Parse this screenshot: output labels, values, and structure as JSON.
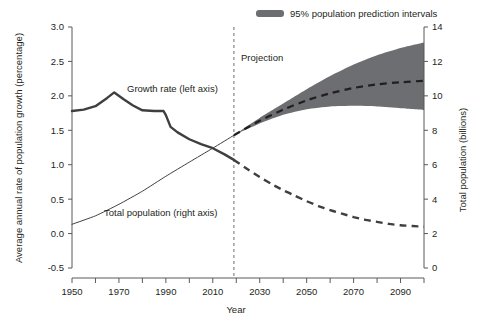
{
  "chart_data": {
    "type": "line",
    "title": "",
    "xlabel": "Year",
    "ylabel": "Average annual rate of population growth (percentage)",
    "y2label": "Total population (billions)",
    "xlim": [
      1950,
      2100
    ],
    "ylim": [
      -0.5,
      3.0
    ],
    "y2lim": [
      0,
      14
    ],
    "grid": false,
    "legend_position": "top-right",
    "x_ticks": [
      1950,
      1960,
      1970,
      1980,
      1990,
      2000,
      2010,
      2020,
      2030,
      2040,
      2050,
      2060,
      2070,
      2080,
      2090,
      2100
    ],
    "x_tick_labels": [
      "1950",
      "",
      "1970",
      "",
      "1990",
      "",
      "2010",
      "",
      "2030",
      "",
      "2050",
      "",
      "2070",
      "",
      "2090",
      ""
    ],
    "y_ticks": [
      -0.5,
      0.0,
      0.5,
      1.0,
      1.5,
      2.0,
      2.5,
      3.0
    ],
    "y_tick_labels": [
      "-0.5",
      "0.0",
      "0.5",
      "1.0",
      "1.5",
      "2.0",
      "2.5",
      "3.0"
    ],
    "y2_ticks": [
      0,
      2,
      4,
      6,
      8,
      10,
      12,
      14
    ],
    "y2_tick_labels": [
      "0",
      "2",
      "4",
      "6",
      "8",
      "10",
      "12",
      "14"
    ],
    "projection_year": 2019,
    "annotations": [
      {
        "text": "Projection",
        "x": 2022,
        "y": 2.32
      },
      {
        "text": "Growth rate (left axis)",
        "x": 1975,
        "y": 2.08
      },
      {
        "text": "Total population (right axis)",
        "x": 1984,
        "y": 0.32
      }
    ],
    "legend": [
      {
        "label": "95% population prediction intervals",
        "color": "#6d6e71",
        "type": "band"
      }
    ],
    "series": [
      {
        "name": "Growth rate (left axis) - historical",
        "axis": "left",
        "style": "solid",
        "color": "#3f3f3f",
        "x": [
          1950,
          1955,
          1960,
          1965,
          1968,
          1972,
          1976,
          1980,
          1985,
          1989,
          1990,
          1992,
          1995,
          2000,
          2005,
          2010,
          2015,
          2019
        ],
        "values": [
          1.78,
          1.8,
          1.85,
          1.97,
          2.05,
          1.95,
          1.86,
          1.79,
          1.78,
          1.78,
          1.72,
          1.55,
          1.47,
          1.37,
          1.3,
          1.24,
          1.15,
          1.07
        ]
      },
      {
        "name": "Growth rate (left axis) - projected",
        "axis": "left",
        "style": "dashed",
        "color": "#3f3f3f",
        "x": [
          2019,
          2025,
          2030,
          2035,
          2040,
          2045,
          2050,
          2055,
          2060,
          2065,
          2070,
          2075,
          2080,
          2085,
          2090,
          2095,
          2100
        ],
        "values": [
          1.07,
          0.93,
          0.82,
          0.72,
          0.63,
          0.55,
          0.47,
          0.4,
          0.34,
          0.29,
          0.24,
          0.2,
          0.17,
          0.14,
          0.12,
          0.11,
          0.1
        ]
      },
      {
        "name": "Total population (right axis) - historical",
        "axis": "right",
        "style": "solid",
        "color": "#3f3f3f",
        "x": [
          1950,
          1960,
          1970,
          1980,
          1990,
          2000,
          2010,
          2019
        ],
        "values": [
          2.54,
          3.03,
          3.7,
          4.46,
          5.33,
          6.15,
          6.96,
          7.71
        ]
      },
      {
        "name": "Total population (right axis) - projected (median)",
        "axis": "right",
        "style": "dashed",
        "color": "#231f20",
        "x": [
          2019,
          2025,
          2030,
          2040,
          2050,
          2060,
          2070,
          2080,
          2090,
          2100
        ],
        "values": [
          7.71,
          8.18,
          8.55,
          9.2,
          9.74,
          10.15,
          10.46,
          10.67,
          10.79,
          10.88
        ]
      },
      {
        "name": "95% population prediction intervals - upper",
        "axis": "right",
        "style": "band",
        "color": "#6d6e71",
        "x": [
          2019,
          2025,
          2030,
          2040,
          2050,
          2060,
          2070,
          2080,
          2090,
          2100
        ],
        "values": [
          7.71,
          8.28,
          8.72,
          9.55,
          10.38,
          11.15,
          11.82,
          12.36,
          12.78,
          13.1
        ]
      },
      {
        "name": "95% population prediction intervals - lower",
        "axis": "right",
        "style": "band",
        "color": "#6d6e71",
        "x": [
          2019,
          2025,
          2030,
          2040,
          2050,
          2060,
          2070,
          2080,
          2090,
          2100
        ],
        "values": [
          7.71,
          8.1,
          8.4,
          8.9,
          9.22,
          9.38,
          9.42,
          9.38,
          9.28,
          9.18
        ]
      }
    ]
  },
  "axes": {
    "left_title": "Average annual rate of population growth (percentage)",
    "right_title": "Total population (billions)",
    "bottom_title": "Year"
  },
  "labels": {
    "growth_rate": "Growth rate (left axis)",
    "total_population": "Total population (right axis)",
    "projection": "Projection"
  },
  "legend": {
    "interval_label": "95% population prediction intervals"
  },
  "colors": {
    "band": "#6d6e71",
    "line": "#3f3f3f",
    "axis": "#58595b",
    "text": "#231f20",
    "background": "#ffffff"
  }
}
